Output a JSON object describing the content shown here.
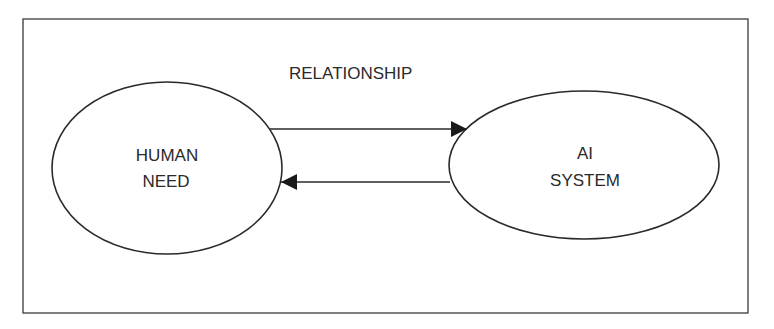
{
  "diagram": {
    "title": "RELATIONSHIP",
    "nodes": [
      {
        "id": "human-need",
        "lines": [
          "HUMAN",
          "NEED"
        ]
      },
      {
        "id": "ai-system",
        "lines": [
          "AI",
          "SYSTEM"
        ]
      }
    ],
    "edges": [
      {
        "from": "human-need",
        "to": "ai-system",
        "direction": "right"
      },
      {
        "from": "ai-system",
        "to": "human-need",
        "direction": "left"
      }
    ],
    "colors": {
      "stroke": "#2a2a2a",
      "background": "#ffffff"
    }
  }
}
